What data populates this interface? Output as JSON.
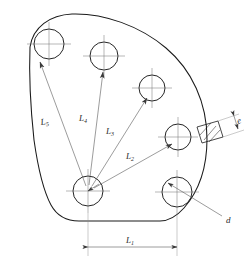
{
  "drawing": {
    "title": "Cam plate hole pattern engineering drawing",
    "caption": "",
    "colors": {
      "outline": "#1a1a1a",
      "centerline": "#6f6f6f",
      "dimension": "#4a4a4a",
      "background": "#ffffff"
    },
    "labels": {
      "l1": {
        "base": "L",
        "sub": "1",
        "role": "horizontal-span-dimension"
      },
      "l2": {
        "base": "L",
        "sub": "2",
        "role": "radial-dimension"
      },
      "l3": {
        "base": "L",
        "sub": "3",
        "role": "radial-dimension"
      },
      "l4": {
        "base": "L",
        "sub": "4",
        "role": "radial-dimension"
      },
      "l5": {
        "base": "L",
        "sub": "5",
        "role": "radial-dimension"
      },
      "d": {
        "base": "d",
        "sub": "",
        "role": "hole-diameter-callout"
      },
      "e": {
        "base": "e",
        "sub": "",
        "role": "section-thickness-dimension"
      }
    },
    "holes": [
      {
        "name": "hole-top-left",
        "cx": 49,
        "cy": 44,
        "r": 15
      },
      {
        "name": "hole-top-middle",
        "cx": 104,
        "cy": 56,
        "r": 14
      },
      {
        "name": "hole-upper-right",
        "cx": 152,
        "cy": 88,
        "r": 13
      },
      {
        "name": "hole-mid-right",
        "cx": 178,
        "cy": 137,
        "r": 13
      },
      {
        "name": "hole-lower-right",
        "cx": 177,
        "cy": 192,
        "r": 15
      },
      {
        "name": "hole-hub-center",
        "cx": 88,
        "cy": 191,
        "r": 15
      }
    ]
  }
}
